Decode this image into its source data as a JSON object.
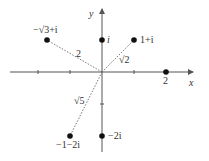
{
  "diagram": {
    "type": "complex-plane",
    "axes": {
      "x_label": "x",
      "y_label": "y"
    },
    "points": [
      {
        "id": "i",
        "label": "i",
        "re": 0,
        "im": 1
      },
      {
        "id": "one-plus-i",
        "label": "1+i",
        "re": 1,
        "im": 1
      },
      {
        "id": "neg-sqrt3-plus-i",
        "label": "−√3+i",
        "re": -1.732,
        "im": 1
      },
      {
        "id": "two",
        "label": "2",
        "re": 2,
        "im": 0
      },
      {
        "id": "neg-one-minus-2i",
        "label": "−1−2i",
        "re": -1,
        "im": -2
      },
      {
        "id": "neg-2i",
        "label": "−2i",
        "re": 0,
        "im": -2
      }
    ],
    "moduli": [
      {
        "to": "neg-sqrt3-plus-i",
        "label": "2"
      },
      {
        "to": "one-plus-i",
        "label": "√2"
      },
      {
        "to": "neg-one-minus-2i",
        "label": "√5"
      }
    ]
  }
}
